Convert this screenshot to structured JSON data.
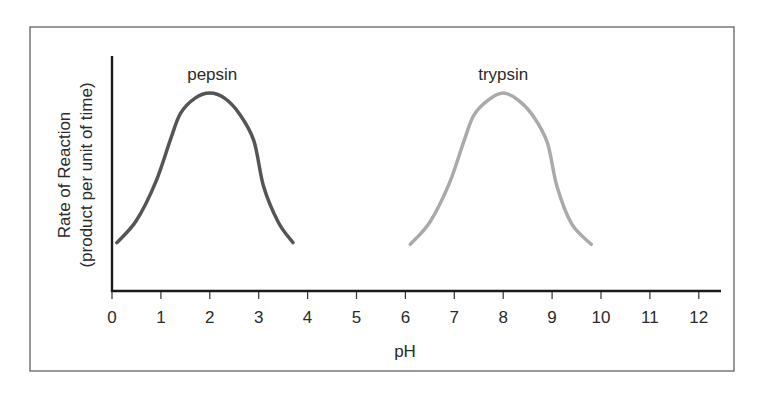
{
  "chart_data": {
    "type": "line",
    "title": "",
    "xlabel": "pH",
    "ylabel": "Rate of Reaction",
    "ylabel_line2": "(product per unit of time)",
    "xlim": [
      0,
      12.5
    ],
    "ylim": [
      0,
      1
    ],
    "x_ticks": [
      0,
      1,
      2,
      3,
      4,
      5,
      6,
      7,
      8,
      9,
      10,
      11,
      12
    ],
    "x_tick_labels": [
      "0",
      "1",
      "2",
      "3",
      "4",
      "5",
      "6",
      "7",
      "8",
      "9",
      "10",
      "11",
      "12"
    ],
    "y_ticks": [],
    "grid": false,
    "legend": "none (curves labeled directly above peaks)",
    "series": [
      {
        "name": "pepsin",
        "color": "#555555",
        "label_position": {
          "x": 2.05,
          "y": 1.08
        },
        "x": [
          0.1,
          0.5,
          0.9,
          1.2,
          1.4,
          1.7,
          2.0,
          2.3,
          2.6,
          2.9,
          3.1,
          3.4,
          3.7
        ],
        "y": [
          0.12,
          0.25,
          0.48,
          0.73,
          0.88,
          0.97,
          1.0,
          0.97,
          0.88,
          0.72,
          0.45,
          0.24,
          0.12
        ]
      },
      {
        "name": "trypsin",
        "color": "#aaaaaa",
        "label_position": {
          "x": 8.0,
          "y": 1.08
        },
        "x": [
          6.1,
          6.5,
          6.9,
          7.2,
          7.4,
          7.7,
          8.0,
          8.3,
          8.6,
          8.9,
          9.1,
          9.4,
          9.8
        ],
        "y": [
          0.11,
          0.24,
          0.47,
          0.72,
          0.87,
          0.96,
          1.0,
          0.96,
          0.87,
          0.71,
          0.45,
          0.23,
          0.11
        ]
      }
    ]
  }
}
